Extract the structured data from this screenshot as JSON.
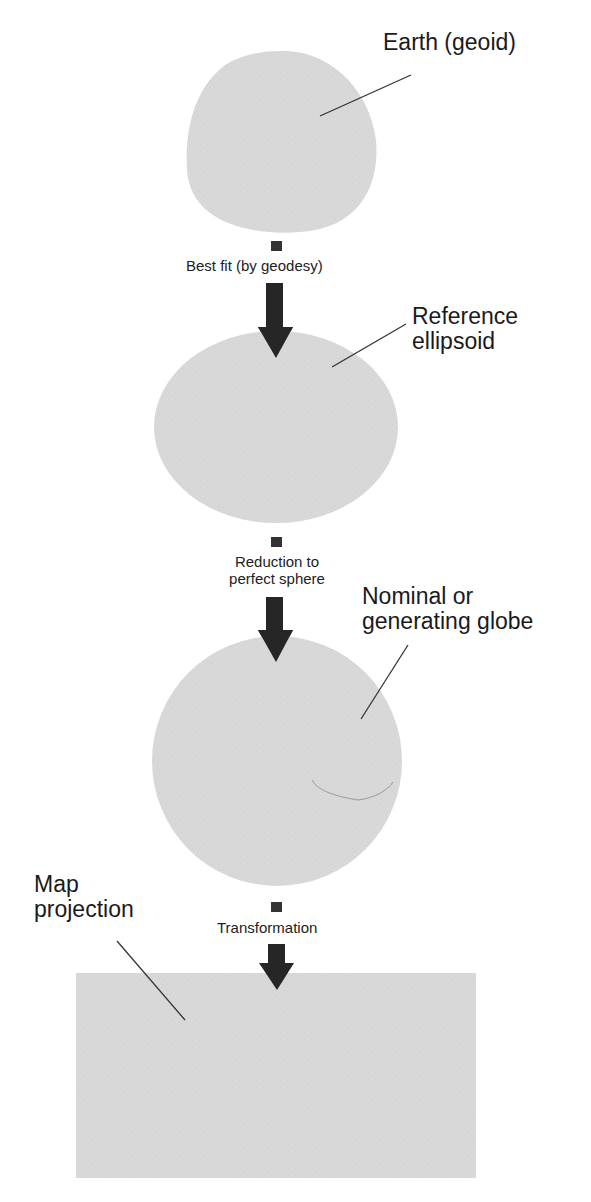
{
  "colors": {
    "shape_fill": "#d9d9d9",
    "shape_texture": "#cfcfcf",
    "arrow": "#262626",
    "line": "#333333",
    "background": "#ffffff"
  },
  "stages": [
    {
      "id": "geoid",
      "label": "Earth (geoid)",
      "shape": "irregular-blob"
    },
    {
      "id": "ellipsoid",
      "label_line1": "Reference",
      "label_line2": "ellipsoid",
      "shape": "ellipse"
    },
    {
      "id": "globe",
      "label_line1": "Nominal or",
      "label_line2": "generating globe",
      "shape": "circle"
    },
    {
      "id": "map",
      "label_line1": "Map",
      "label_line2": "projection",
      "shape": "rectangle"
    }
  ],
  "transitions": [
    {
      "label": "Best fit (by geodesy)",
      "icon": "down-arrow-icon"
    },
    {
      "label_line1": "Reduction to",
      "label_line2": "perfect sphere",
      "icon": "down-arrow-icon"
    },
    {
      "label": "Transformation",
      "icon": "down-arrow-icon"
    }
  ]
}
